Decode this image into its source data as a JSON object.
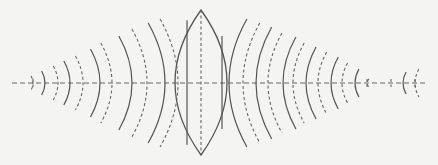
{
  "diagram": {
    "type": "lens-wavefront-diagram",
    "colors": {
      "background": "#f4f4f2",
      "line": "#555555",
      "dashed": "#666666"
    },
    "axis": {
      "x1": 12,
      "x2": 428,
      "y": 83
    },
    "lens": {
      "cx": 201,
      "top": 10,
      "bottom": 155,
      "half_width": 26,
      "inner_lines_x": [
        187,
        222
      ]
    },
    "left_wavefronts": {
      "solid": [
        {
          "x": 45,
          "h": 12
        },
        {
          "x": 70,
          "h": 22
        },
        {
          "x": 100,
          "h": 34
        },
        {
          "x": 132,
          "h": 47
        },
        {
          "x": 165,
          "h": 60
        }
      ],
      "dashed": [
        {
          "x": 33,
          "h": 7
        },
        {
          "x": 58,
          "h": 17
        },
        {
          "x": 83,
          "h": 27
        },
        {
          "x": 112,
          "h": 40
        },
        {
          "x": 147,
          "h": 54
        },
        {
          "x": 178,
          "h": 64
        }
      ]
    },
    "right_wavefronts": {
      "solid": [
        {
          "x": 229,
          "h": 64
        },
        {
          "x": 256,
          "h": 56
        },
        {
          "x": 283,
          "h": 46
        },
        {
          "x": 306,
          "h": 36
        },
        {
          "x": 331,
          "h": 26
        },
        {
          "x": 355,
          "h": 14
        },
        {
          "x": 403,
          "h": 11
        }
      ],
      "dashed": [
        {
          "x": 243,
          "h": 60
        },
        {
          "x": 268,
          "h": 50
        },
        {
          "x": 293,
          "h": 40
        },
        {
          "x": 318,
          "h": 31
        },
        {
          "x": 342,
          "h": 20
        },
        {
          "x": 367,
          "h": 4
        },
        {
          "x": 415,
          "h": 14
        }
      ]
    },
    "tick_marks_x": [
      33,
      367,
      391,
      415
    ]
  }
}
